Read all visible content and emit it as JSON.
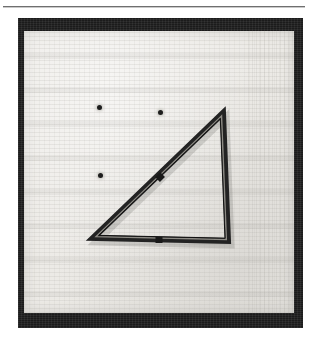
{
  "page": {
    "background_color": "#ffffff",
    "rule": {
      "name": "horizontal-rule",
      "color": "#6f6f6f",
      "x": 3,
      "y": 6,
      "width": 302
    }
  },
  "figure": {
    "kind": "halftone-photograph",
    "photo_border_color": "#1b1b1b",
    "board_color": "#eceae6",
    "rod_color": "#2a2a2a",
    "photo": {
      "x": 18,
      "y": 18,
      "width": 285,
      "height": 310
    },
    "board": {
      "x": 24,
      "y": 31,
      "width": 270,
      "height": 282
    }
  },
  "pegboard": {
    "dot_color": "#1d1d1d",
    "dots": [
      {
        "name": "peg-dot-1",
        "x": 75,
        "y": 76
      },
      {
        "name": "peg-dot-2",
        "x": 136,
        "y": 81
      },
      {
        "name": "peg-dot-3",
        "x": 76,
        "y": 144
      }
    ]
  },
  "triangle": {
    "name": "triangular-rod-frame",
    "shape": "right-triangle",
    "right_angle_at": "bottom-right",
    "vertices": [
      {
        "name": "apex-vertex",
        "x": 199,
        "y": 82
      },
      {
        "name": "bottom-left-vertex",
        "x": 69,
        "y": 207
      },
      {
        "name": "bottom-right-vertex",
        "x": 204,
        "y": 210
      }
    ],
    "members": [
      {
        "name": "hypotenuse-rod",
        "from": "apex-vertex",
        "to": "bottom-left-vertex"
      },
      {
        "name": "bottom-rod",
        "from": "bottom-left-vertex",
        "to": "bottom-right-vertex"
      },
      {
        "name": "vertical-rod",
        "from": "bottom-right-vertex",
        "to": "apex-vertex"
      }
    ],
    "joints": [
      {
        "name": "hypotenuse-midpoint-joint",
        "x": 136,
        "y": 146
      },
      {
        "name": "bottom-midpoint-joint",
        "x": 135,
        "y": 209
      }
    ]
  }
}
